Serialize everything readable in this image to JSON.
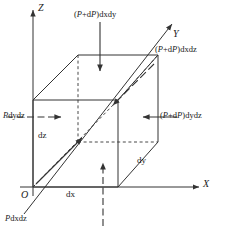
{
  "figure": {
    "type": "diagram",
    "background_color": "#ffffff",
    "line_color": "#333333"
  },
  "axes": {
    "x_label": "X",
    "y_label": "Y",
    "z_label": "Z",
    "origin_label": "O"
  },
  "dimensions": {
    "dx": "dx",
    "dy": "dy",
    "dz": "dz"
  },
  "forces": {
    "top": "(P+dP)dxdy",
    "back_top_right": "(P+dP)dxdz",
    "right": "(P+dP)dydz",
    "left": "Pdydz",
    "bottom_left": "Pdxdz"
  },
  "force_parts": {
    "top": {
      "open": "(",
      "p1": "P",
      "plus": "+",
      "d": "d",
      "p2": "P",
      "close": ")",
      "tail": "dxdy"
    },
    "back_top_right": {
      "open": "(",
      "p1": "P",
      "plus": "+",
      "d": "d",
      "p2": "P",
      "close": ")",
      "tail": "dxdz"
    },
    "right": {
      "open": "(",
      "p1": "P",
      "plus": "+",
      "d": "d",
      "p2": "P",
      "close": ")",
      "tail": "dydz"
    },
    "left": {
      "p": "P",
      "tail": "dydz"
    },
    "bottom_left": {
      "p": "P",
      "tail": "dxdz"
    }
  },
  "arrows": {
    "top_arrow": "arrow-down-solid",
    "bottom_arrow": "arrow-up-dashed",
    "right_arrow": "arrow-left-solid",
    "left_arrow": "arrow-right-dashed",
    "back_arrow": "arrow-down-left-solid",
    "front_arrow": "arrow-up-right-solid",
    "x_axis_arrow": "arrow-right-axis",
    "y_axis_arrow": "arrow-up-right-axis",
    "z_axis_arrow": "arrow-up-axis"
  }
}
